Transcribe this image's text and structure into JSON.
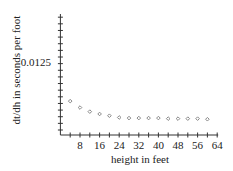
{
  "chart_data": {
    "type": "scatter",
    "title": "",
    "xlabel": "height in feet",
    "ylabel": "dt/dh in seconds per foot",
    "xlim": [
      0,
      64
    ],
    "ylim": [
      0,
      0.0175
    ],
    "x_ticks": [
      8,
      16,
      24,
      32,
      40,
      48,
      56,
      64
    ],
    "x_minor_step": 4,
    "y_tick_labels": [
      {
        "value": 0.0125,
        "label": "0.0125"
      }
    ],
    "y_minor_step": 0.00083,
    "grid": false,
    "legend": null,
    "marker": "diamond",
    "marker_color": "#888888",
    "x": [
      4,
      8,
      12,
      16,
      20,
      24,
      28,
      32,
      36,
      40,
      44,
      48,
      52,
      56,
      60
    ],
    "y": [
      0.0058,
      0.0047,
      0.004,
      0.0036,
      0.0033,
      0.003,
      0.0029,
      0.0029,
      0.0029,
      0.0029,
      0.0028,
      0.0028,
      0.0028,
      0.0028,
      0.0027
    ]
  },
  "labels": {
    "xlabel": "height in feet",
    "ylabel": "dt/dh in seconds per foot",
    "ytick": "0.0125"
  }
}
